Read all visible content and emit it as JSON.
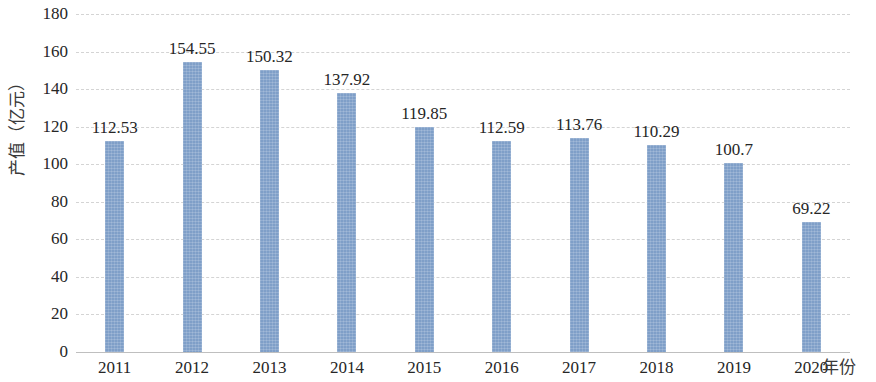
{
  "chart_data": {
    "type": "bar",
    "title": "",
    "xlabel": "年份",
    "ylabel": "产值（亿元）",
    "categories": [
      "2011",
      "2012",
      "2013",
      "2014",
      "2015",
      "2016",
      "2017",
      "2018",
      "2019",
      "2020"
    ],
    "values": [
      112.53,
      154.55,
      150.32,
      137.92,
      119.85,
      112.59,
      113.76,
      110.29,
      100.7,
      69.22
    ],
    "value_labels": [
      "112.53",
      "154.55",
      "150.32",
      "137.92",
      "119.85",
      "112.59",
      "113.76",
      "110.29",
      "100.7",
      "69.22"
    ],
    "ylim": [
      0,
      180
    ],
    "ytick_step": 20,
    "yticks": [
      0,
      20,
      40,
      60,
      80,
      100,
      120,
      140,
      160,
      180
    ],
    "ytick_labels": [
      "0",
      "20",
      "40",
      "60",
      "80",
      "100",
      "120",
      "140",
      "160",
      "180"
    ],
    "grid": true,
    "grid_axis": "y",
    "grid_style": "dashed",
    "legend": false,
    "series": [
      {
        "name": "产值",
        "values": [
          112.53,
          154.55,
          150.32,
          137.92,
          119.85,
          112.59,
          113.76,
          110.29,
          100.7,
          69.22
        ]
      }
    ],
    "colors": {
      "bar": "#7f9fc8",
      "gridline": "#d4d4d4",
      "axis": "#bfbfbf",
      "text": "#262626",
      "background": "#ffffff"
    }
  }
}
